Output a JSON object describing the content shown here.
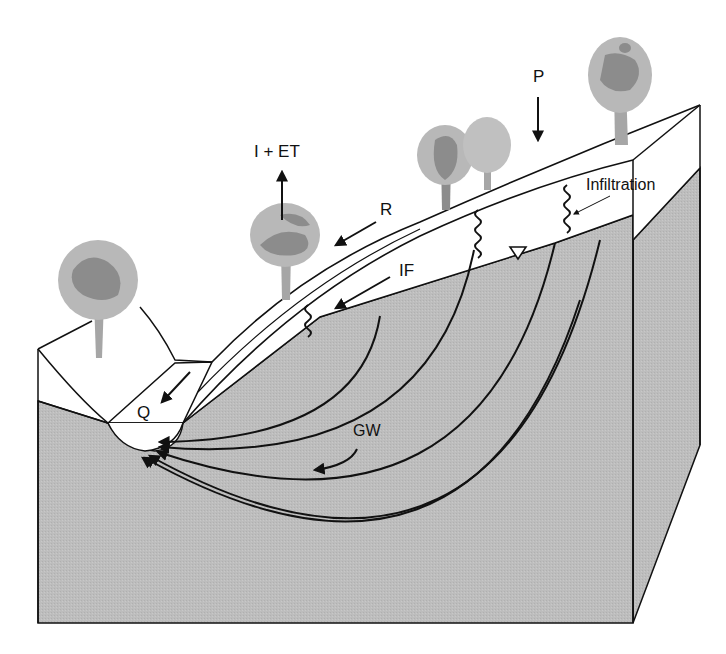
{
  "diagram": {
    "labels": {
      "precipitation": "P",
      "interception_evapotranspiration": "I + ET",
      "runoff": "R",
      "interflow": "IF",
      "infiltration": "Infiltration",
      "groundwater": "GW",
      "streamflow": "Q"
    },
    "colors": {
      "ground": "#bdbdbd",
      "ground_side": "#c4c4c4",
      "soil": "#ffffff",
      "line": "#111111",
      "tree_light": "#b8b8b8",
      "tree_dark": "#8c8c8c",
      "trunk": "#a6a6a6"
    }
  }
}
